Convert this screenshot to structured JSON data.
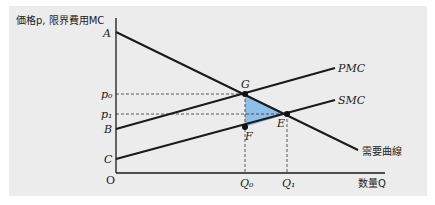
{
  "figure": {
    "y_axis_label": "価格p, 限界費用MC",
    "x_axis_label": "数量Q",
    "origin_label": "O"
  },
  "points": {
    "A": "A",
    "B": "B",
    "C": "C",
    "G": "G",
    "E": "E",
    "F": "F"
  },
  "price_labels": {
    "p0": "p₀",
    "p1": "p₁"
  },
  "quantity_labels": {
    "Q0": "Q₀",
    "Q1": "Q₁"
  },
  "curves": {
    "pmc": "PMC",
    "smc": "SMC",
    "demand": "需要曲線"
  },
  "colors": {
    "shaded_triangle": "#8fbfe8",
    "lines": "#1a1a1a",
    "background": "#ececec"
  }
}
